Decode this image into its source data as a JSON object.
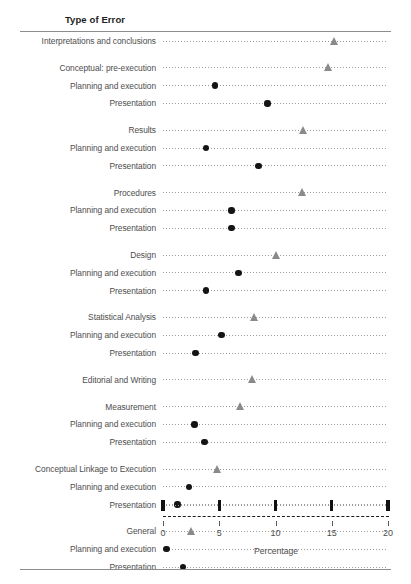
{
  "figure": {
    "column_header": "Type of Error",
    "x_axis_title": "Percentage"
  },
  "chart_data": {
    "type": "scatter",
    "title": "Type of Error",
    "xlabel": "Percentage",
    "ylabel": "Type of Error",
    "xlim": [
      0,
      20
    ],
    "xticks": [
      0,
      5,
      10,
      15,
      20
    ],
    "xticklabels": [
      "0",
      "5",
      "10",
      "15",
      "20"
    ],
    "grid": "dotted-horizontal-rows",
    "legend": "none",
    "series": [
      {
        "name": "Category (triangle marker)",
        "marker": "triangle",
        "color": "#8a8a8a"
      },
      {
        "name": "Sub-item (circle marker)",
        "marker": "circle",
        "color": "#141414"
      }
    ],
    "rows": [
      {
        "label": "Interpretations and conclusions",
        "value": 15.3,
        "marker": "triangle",
        "level": 0,
        "gap_before": false
      },
      {
        "label": "Conceptual: pre-execution",
        "value": 14.7,
        "marker": "triangle",
        "level": 0,
        "gap_before": true
      },
      {
        "label": "Planning and execution",
        "value": 4.6,
        "marker": "circle",
        "level": 1,
        "gap_before": false
      },
      {
        "label": "Presentation",
        "value": 9.3,
        "marker": "circle",
        "level": 1,
        "gap_before": false
      },
      {
        "label": "Results",
        "value": 12.5,
        "marker": "triangle",
        "level": 0,
        "gap_before": true
      },
      {
        "label": "Planning and execution",
        "value": 3.8,
        "marker": "circle",
        "level": 1,
        "gap_before": false
      },
      {
        "label": "Presentation",
        "value": 8.5,
        "marker": "circle",
        "level": 1,
        "gap_before": false
      },
      {
        "label": "Procedures",
        "value": 12.4,
        "marker": "triangle",
        "level": 0,
        "gap_before": true
      },
      {
        "label": "Planning and execution",
        "value": 6.1,
        "marker": "circle",
        "level": 1,
        "gap_before": false
      },
      {
        "label": "Presentation",
        "value": 6.1,
        "marker": "circle",
        "level": 1,
        "gap_before": false
      },
      {
        "label": "Design",
        "value": 10.1,
        "marker": "triangle",
        "level": 0,
        "gap_before": true
      },
      {
        "label": "Planning and execution",
        "value": 6.7,
        "marker": "circle",
        "level": 1,
        "gap_before": false
      },
      {
        "label": "Presentation",
        "value": 3.8,
        "marker": "circle",
        "level": 1,
        "gap_before": false
      },
      {
        "label": "Statistical Analysis",
        "value": 8.2,
        "marker": "triangle",
        "level": 0,
        "gap_before": true
      },
      {
        "label": "Planning and execution",
        "value": 5.2,
        "marker": "circle",
        "level": 1,
        "gap_before": false
      },
      {
        "label": "Presentation",
        "value": 2.9,
        "marker": "circle",
        "level": 1,
        "gap_before": false
      },
      {
        "label": "Editorial and Writing",
        "value": 8.0,
        "marker": "triangle",
        "level": 0,
        "gap_before": true
      },
      {
        "label": "Measurement",
        "value": 6.9,
        "marker": "triangle",
        "level": 0,
        "gap_before": true
      },
      {
        "label": "Planning and execution",
        "value": 2.8,
        "marker": "circle",
        "level": 1,
        "gap_before": false
      },
      {
        "label": "Presentation",
        "value": 3.7,
        "marker": "circle",
        "level": 1,
        "gap_before": false
      },
      {
        "label": "Conceptual Linkage to Execution",
        "value": 4.9,
        "marker": "triangle",
        "level": 0,
        "gap_before": true
      },
      {
        "label": "Planning and execution",
        "value": 2.3,
        "marker": "circle",
        "level": 1,
        "gap_before": false
      },
      {
        "label": "Presentation",
        "value": 1.3,
        "marker": "circle",
        "level": 1,
        "gap_before": false
      },
      {
        "label": "General",
        "value": 2.6,
        "marker": "triangle",
        "level": 0,
        "gap_before": true
      },
      {
        "label": "Planning and execution",
        "value": 0.3,
        "marker": "circle",
        "level": 1,
        "gap_before": false
      },
      {
        "label": "Presentation",
        "value": 1.8,
        "marker": "circle",
        "level": 1,
        "gap_before": false
      }
    ]
  }
}
